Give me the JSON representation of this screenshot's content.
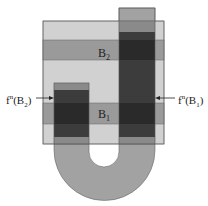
{
  "diagram": {
    "labels": {
      "b2": "B",
      "b2_sub": "2",
      "b1": "B",
      "b1_sub": "1",
      "fn_b2": {
        "f": "f",
        "sup": "n",
        "open": "(B",
        "sub": "2",
        "close": ")"
      },
      "fn_b1": {
        "f": "f",
        "sup": "n",
        "open": "(B",
        "sub": "1",
        "close": ")"
      }
    },
    "colors": {
      "square": "#c9c9c9",
      "band": "#9a9a9a",
      "u_shape": "#a2a2a2",
      "overlap_dark": "#3c3c3c",
      "overlap_mid": "#6e6e6e",
      "outline": "#555555",
      "arrow": "#222222"
    }
  }
}
